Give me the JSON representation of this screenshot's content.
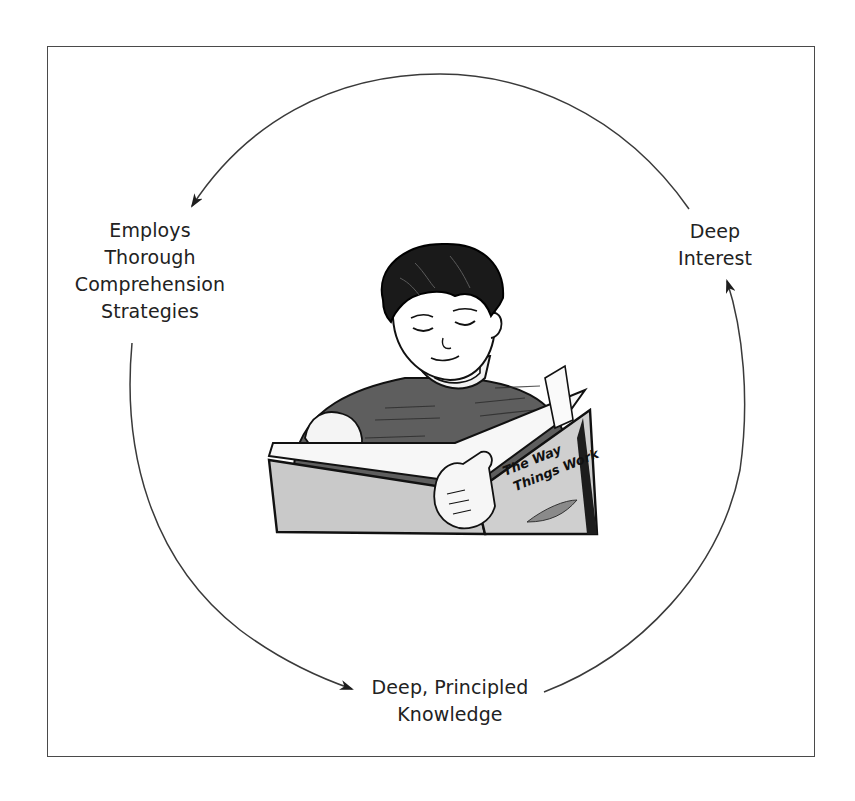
{
  "diagram": {
    "type": "cycle",
    "nodes": [
      {
        "id": "deep-interest",
        "lines": [
          "Deep",
          "Interest"
        ],
        "position": "right"
      },
      {
        "id": "comprehension-strategies",
        "lines": [
          "Employs",
          "Thorough",
          "Comprehension",
          "Strategies"
        ],
        "position": "left"
      },
      {
        "id": "principled-knowledge",
        "lines": [
          "Deep, Principled",
          "Knowledge"
        ],
        "position": "bottom"
      }
    ],
    "edges": [
      {
        "from": "deep-interest",
        "to": "comprehension-strategies",
        "direction": "counterclockwise",
        "arc": "top"
      },
      {
        "from": "comprehension-strategies",
        "to": "principled-knowledge",
        "direction": "counterclockwise",
        "arc": "left-bottom"
      },
      {
        "from": "principled-knowledge",
        "to": "deep-interest",
        "direction": "counterclockwise",
        "arc": "bottom-right"
      }
    ],
    "center_illustration": {
      "subject": "boy reading a book",
      "book_title": "The Way Things Work"
    }
  },
  "labels": {
    "left": [
      "Employs",
      "Thorough",
      "Comprehension",
      "Strategies"
    ],
    "right": [
      "Deep",
      "Interest"
    ],
    "bottom": [
      "Deep, Principled",
      "Knowledge"
    ]
  },
  "illustration": {
    "book_title_line1": "The Way",
    "book_title_line2": "Things Work"
  },
  "colors": {
    "line": "#3a3a3a",
    "text": "#222222",
    "frame": "#4a4a4a",
    "book_cover": "#c9c9c9"
  }
}
